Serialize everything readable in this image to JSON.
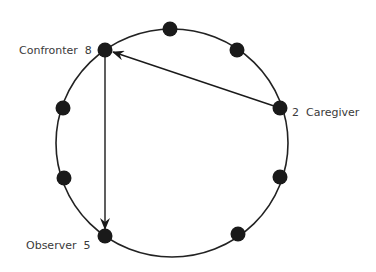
{
  "diagram": {
    "type": "role-circle",
    "circle": {
      "cx": 172,
      "cy": 143,
      "rx": 116,
      "ry": 114,
      "stroke": "#222222"
    },
    "dot_color": "#1a1a1a",
    "nodes": [
      {
        "id": "top",
        "x": 170,
        "y": 29,
        "label": ""
      },
      {
        "id": "top-right",
        "x": 237,
        "y": 50,
        "label": ""
      },
      {
        "id": "caregiver",
        "x": 280,
        "y": 108,
        "number": "2",
        "label": "Caregiver"
      },
      {
        "id": "right-lower",
        "x": 280,
        "y": 177,
        "label": ""
      },
      {
        "id": "bottom-right",
        "x": 238,
        "y": 234,
        "label": ""
      },
      {
        "id": "observer",
        "x": 105,
        "y": 236,
        "number": "5",
        "label": "Observer"
      },
      {
        "id": "left-lower",
        "x": 64,
        "y": 178,
        "label": ""
      },
      {
        "id": "left-upper",
        "x": 63,
        "y": 108,
        "label": ""
      },
      {
        "id": "confronter",
        "x": 105,
        "y": 50,
        "number": "8",
        "label": "Confronter"
      }
    ],
    "labels": {
      "confronter": "Confronter  8",
      "caregiver": "2  Caregiver",
      "observer": "Observer  5"
    },
    "edges": [
      {
        "from": "caregiver",
        "to": "confronter",
        "directed": true
      },
      {
        "from": "confronter",
        "to": "observer",
        "directed": true
      }
    ]
  }
}
